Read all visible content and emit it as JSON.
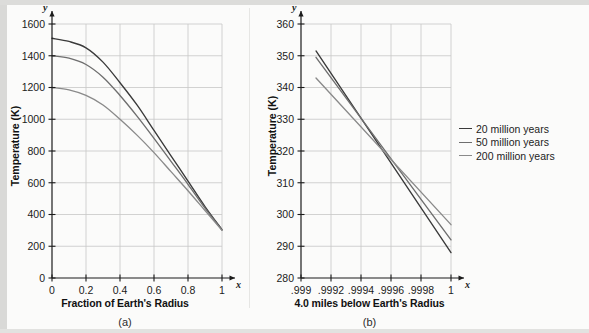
{
  "figure": {
    "panel_a_caption": "(a)",
    "panel_b_caption": "(b)"
  },
  "legend": {
    "position": "right",
    "items": [
      {
        "label": "20 million years",
        "color": "#3a3a3a"
      },
      {
        "label": "50 million years",
        "color": "#6e6e6e"
      },
      {
        "label": "200 million years",
        "color": "#8a8a8a"
      }
    ]
  },
  "chart_data": [
    {
      "type": "line",
      "panel": "(a)",
      "title": "",
      "xlabel": "Fraction of Earth's Radius",
      "ylabel": "Temperature (K)",
      "xlim": [
        0,
        1.0
      ],
      "ylim": [
        0,
        1600
      ],
      "xticks": [
        "0",
        "0.2",
        "0.4",
        "0.6",
        "0.8",
        "1"
      ],
      "xtick_values": [
        0,
        0.2,
        0.4,
        0.6,
        0.8,
        1
      ],
      "yticks": [
        "0",
        "200",
        "400",
        "600",
        "800",
        "1000",
        "1200",
        "1400",
        "1600"
      ],
      "ytick_values": [
        0,
        200,
        400,
        600,
        800,
        1000,
        1200,
        1400,
        1600
      ],
      "grid": true,
      "x_axis_symbol": "x",
      "y_axis_symbol": "y",
      "x": [
        0,
        0.1,
        0.2,
        0.3,
        0.4,
        0.5,
        0.6,
        0.7,
        0.8,
        0.9,
        1.0
      ],
      "series": [
        {
          "name": "20 million years",
          "color": "#3a3a3a",
          "values": [
            1510,
            1490,
            1450,
            1360,
            1230,
            1090,
            930,
            770,
            610,
            450,
            305
          ]
        },
        {
          "name": "50 million years",
          "color": "#6e6e6e",
          "values": [
            1400,
            1385,
            1345,
            1265,
            1150,
            1020,
            880,
            735,
            590,
            440,
            302
          ]
        },
        {
          "name": "200 million years",
          "color": "#8a8a8a",
          "values": [
            1200,
            1185,
            1150,
            1090,
            1000,
            900,
            790,
            670,
            550,
            425,
            300
          ]
        }
      ]
    },
    {
      "type": "line",
      "panel": "(b)",
      "title": "",
      "xlabel": "4.0 miles below Earth's Radius",
      "ylabel": "Temperature (K)",
      "xlim": [
        0.999,
        1.0
      ],
      "ylim": [
        280,
        360
      ],
      "xticks": [
        ".999",
        ".9992",
        ".9994",
        ".9996",
        ".9998",
        "1"
      ],
      "xtick_values": [
        0.999,
        0.9992,
        0.9994,
        0.9996,
        0.9998,
        1
      ],
      "yticks": [
        "280",
        "290",
        "300",
        "310",
        "320",
        "330",
        "340",
        "350",
        "360"
      ],
      "ytick_values": [
        280,
        290,
        300,
        310,
        320,
        330,
        340,
        350,
        360
      ],
      "grid": true,
      "x_axis_symbol": "x",
      "y_axis_symbol": "y",
      "x": [
        0.9991,
        1.0
      ],
      "series": [
        {
          "name": "20 million years",
          "color": "#3a3a3a",
          "values": [
            351.5,
            288.0
          ]
        },
        {
          "name": "50 million years",
          "color": "#6e6e6e",
          "values": [
            349.5,
            292.0
          ]
        },
        {
          "name": "200 million years",
          "color": "#8a8a8a",
          "values": [
            343.0,
            296.8
          ]
        }
      ]
    }
  ]
}
